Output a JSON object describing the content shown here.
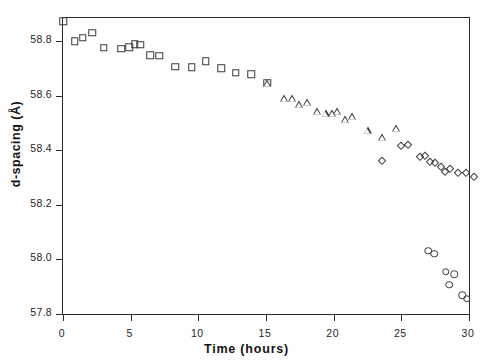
{
  "chart_data": {
    "type": "scatter",
    "title": "",
    "xlabel": "Time (hours)",
    "ylabel": "d-spacing (Å)",
    "xlim": [
      0,
      30
    ],
    "ylim": [
      57.8,
      58.885
    ],
    "xticks": [
      0,
      5,
      10,
      15,
      20,
      25,
      30
    ],
    "xticklabels": [
      "0",
      "5",
      "10",
      "15",
      "20",
      "25",
      "30"
    ],
    "yticks": [
      57.8,
      58.0,
      58.2,
      58.4,
      58.6,
      58.8
    ],
    "yticklabels": [
      "57.8",
      "58.0",
      "58.2",
      "58.4",
      "58.6",
      "58.8"
    ],
    "grid": false,
    "legend": "none",
    "marker_color": "#3a3a3a",
    "marker_fill": "none",
    "series": [
      {
        "name": "phase-1",
        "marker": "square",
        "points": [
          [
            0.0,
            58.873
          ],
          [
            0.85,
            58.8
          ],
          [
            1.45,
            58.812
          ],
          [
            2.15,
            58.831
          ],
          [
            3.0,
            58.776
          ],
          [
            4.3,
            58.773
          ],
          [
            4.9,
            58.778
          ],
          [
            5.3,
            58.789
          ],
          [
            5.7,
            58.787
          ],
          [
            6.45,
            58.748
          ],
          [
            7.1,
            58.747
          ],
          [
            8.3,
            58.707
          ],
          [
            9.5,
            58.705
          ],
          [
            10.55,
            58.727
          ],
          [
            11.7,
            58.7
          ],
          [
            12.75,
            58.684
          ],
          [
            13.9,
            58.678
          ],
          [
            15.1,
            58.647
          ]
        ]
      },
      {
        "name": "phase-2",
        "marker": "triangle",
        "points": [
          [
            15.1,
            58.647
          ],
          [
            16.35,
            58.591
          ],
          [
            16.9,
            58.592
          ],
          [
            17.45,
            58.571
          ],
          [
            18.0,
            58.578
          ],
          [
            18.75,
            58.545
          ],
          [
            19.4,
            58.536
          ],
          [
            19.85,
            58.538
          ],
          [
            20.25,
            58.543
          ],
          [
            20.85,
            58.514
          ],
          [
            21.35,
            58.525
          ],
          [
            22.5,
            58.474
          ],
          [
            23.55,
            58.45
          ],
          [
            24.6,
            58.48
          ]
        ]
      },
      {
        "name": "phase-3",
        "marker": "diamond",
        "points": [
          [
            25.0,
            58.416
          ],
          [
            25.5,
            58.418
          ],
          [
            23.6,
            58.36
          ],
          [
            26.4,
            58.374
          ],
          [
            26.75,
            58.378
          ],
          [
            27.1,
            58.356
          ],
          [
            27.5,
            58.352
          ],
          [
            27.9,
            58.34
          ],
          [
            28.2,
            58.322
          ],
          [
            28.6,
            58.33
          ],
          [
            29.2,
            58.318
          ],
          [
            29.8,
            58.316
          ],
          [
            30.4,
            58.304
          ],
          [
            30.9,
            58.303
          ]
        ]
      },
      {
        "name": "phase-4",
        "marker": "circle",
        "points": [
          [
            27.0,
            58.032
          ],
          [
            27.45,
            58.02
          ],
          [
            28.3,
            57.955
          ],
          [
            28.9,
            57.945
          ],
          [
            28.55,
            57.908
          ],
          [
            29.5,
            57.868
          ],
          [
            29.85,
            57.856
          ]
        ]
      }
    ]
  }
}
